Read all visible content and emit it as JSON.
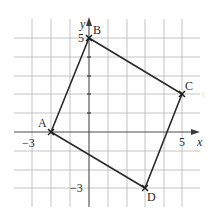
{
  "diagram": {
    "type": "coordinate-plane-quadrilateral",
    "axes": {
      "x_label": "x",
      "y_label": "y",
      "x_range": [
        -4,
        6
      ],
      "y_range": [
        -4,
        6
      ],
      "tick_labels": {
        "x_neg": "−3",
        "x_pos": "5",
        "y_pos": "5",
        "y_neg": "−3"
      }
    },
    "points": [
      {
        "name": "A",
        "x": -2,
        "y": 0
      },
      {
        "name": "B",
        "x": 0,
        "y": 5
      },
      {
        "name": "C",
        "x": 5,
        "y": 2
      },
      {
        "name": "D",
        "x": 3,
        "y": -3
      }
    ],
    "polygon_order": [
      "A",
      "B",
      "C",
      "D"
    ],
    "stray_mark": "t",
    "colors": {
      "grid": "#b8b8b8",
      "axis": "#555555",
      "shape": "#2a2a2a",
      "background": "#ffffff"
    }
  }
}
